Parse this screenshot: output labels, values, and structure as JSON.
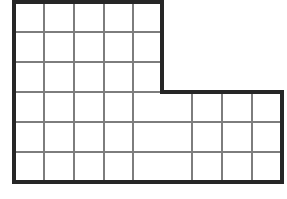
{
  "figure": {
    "name": "l-shaped-grid",
    "background_color": "#ffffff",
    "outline_color": "#262626",
    "outline_width_px": 3.2,
    "gridline_color": "#7d7d7d",
    "gridline_width_px": 1.1,
    "cell_size_px": 30,
    "geometry": {
      "left_x": 14,
      "top_y": 2,
      "bottom_y": 182,
      "right_x": 282,
      "step_x": 162,
      "step_y": 92,
      "upper_block_columns": 5,
      "upper_block_rows": 3,
      "lower_block_columns": 9,
      "lower_block_rows": 3,
      "total_columns": 9,
      "total_rows": 6,
      "total_unit_squares": 42
    },
    "outline_path": "M 14 2 L 162 2 L 162 92 L 282 92 L 282 182 L 14 182 Z",
    "vertical_gridlines": [
      {
        "x": 44,
        "y1": 2,
        "y2": 182
      },
      {
        "x": 74,
        "y1": 2,
        "y2": 182
      },
      {
        "x": 104,
        "y1": 2,
        "y2": 182
      },
      {
        "x": 133,
        "y1": 2,
        "y2": 182
      },
      {
        "x": 192,
        "y1": 92,
        "y2": 182
      },
      {
        "x": 222,
        "y1": 92,
        "y2": 182
      },
      {
        "x": 252,
        "y1": 92,
        "y2": 182
      }
    ],
    "horizontal_gridlines": [
      {
        "y": 32,
        "x1": 14,
        "x2": 162
      },
      {
        "y": 62,
        "x1": 14,
        "x2": 162
      },
      {
        "y": 92,
        "x1": 14,
        "x2": 162
      },
      {
        "y": 122,
        "x1": 14,
        "x2": 282
      },
      {
        "y": 152,
        "x1": 14,
        "x2": 282
      }
    ]
  }
}
